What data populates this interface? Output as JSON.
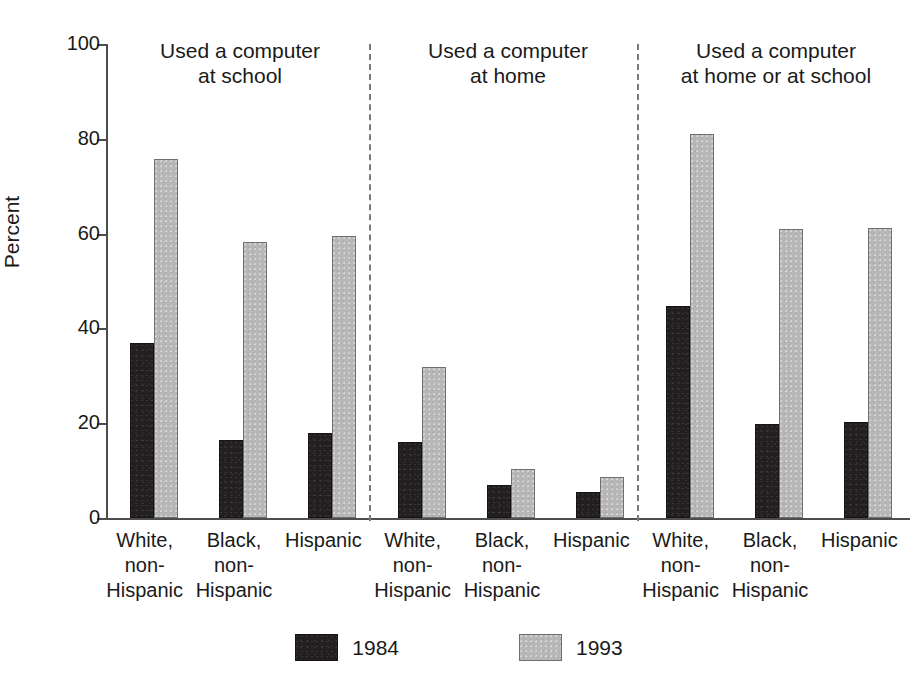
{
  "chart_data": {
    "type": "bar",
    "title": "",
    "xlabel": "",
    "ylabel": "Percent",
    "ylim": [
      0,
      100
    ],
    "ytick_values": [
      100,
      80,
      60,
      40,
      20,
      0
    ],
    "ytick_labels": [
      "100",
      "80",
      "60",
      "40",
      "20",
      "0"
    ],
    "grid": false,
    "legend_position": "bottom-center",
    "categories": [
      "White,\nnon-\nHispanic",
      "Black,\nnon-\nHispanic",
      "Hispanic"
    ],
    "series": [
      {
        "name": "1984",
        "color": "#231f20"
      },
      {
        "name": "1993",
        "color": "#b7b7b7"
      }
    ],
    "panels": [
      {
        "title": "Used a computer\nat school",
        "title_line1": "Used a computer",
        "title_line2": "at school",
        "groups": [
          {
            "label_line1": "White,",
            "label_line2": "non-",
            "label_line3": "Hispanic",
            "values": {
              "1984": 37.0,
              "1993": 75.7
            }
          },
          {
            "label_line1": "Black,",
            "label_line2": "non-",
            "label_line3": "Hispanic",
            "values": {
              "1984": 16.5,
              "1993": 58.3
            }
          },
          {
            "label_line1": "Hispanic",
            "label_line2": "",
            "label_line3": "",
            "values": {
              "1984": 18.0,
              "1993": 59.6
            }
          }
        ]
      },
      {
        "title": "Used a computer\nat home",
        "title_line1": "Used a computer",
        "title_line2": "at home",
        "groups": [
          {
            "label_line1": "White,",
            "label_line2": "non-",
            "label_line3": "Hispanic",
            "values": {
              "1984": 16.1,
              "1993": 31.9
            }
          },
          {
            "label_line1": "Black,",
            "label_line2": "non-",
            "label_line3": "Hispanic",
            "values": {
              "1984": 7.0,
              "1993": 10.4
            }
          },
          {
            "label_line1": "Hispanic",
            "label_line2": "",
            "label_line3": "",
            "values": {
              "1984": 5.5,
              "1993": 8.7
            }
          }
        ]
      },
      {
        "title": "Used a computer\nat home or at school",
        "title_line1": "Used a computer",
        "title_line2": "at home or at school",
        "groups": [
          {
            "label_line1": "White,",
            "label_line2": "non-",
            "label_line3": "Hispanic",
            "values": {
              "1984": 44.7,
              "1993": 81.1
            }
          },
          {
            "label_line1": "Black,",
            "label_line2": "non-",
            "label_line3": "Hispanic",
            "values": {
              "1984": 19.8,
              "1993": 61.0
            }
          },
          {
            "label_line1": "Hispanic",
            "label_line2": "",
            "label_line3": "",
            "values": {
              "1984": 20.3,
              "1993": 61.1
            }
          }
        ]
      }
    ]
  },
  "legend": {
    "entries": [
      {
        "label": "1984",
        "color": "#231f20"
      },
      {
        "label": "1993",
        "color": "#b7b7b7"
      }
    ]
  }
}
